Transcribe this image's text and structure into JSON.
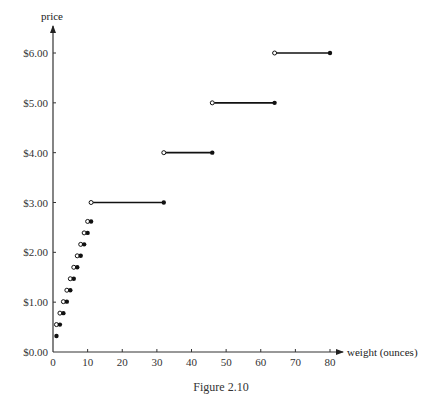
{
  "chart_data": {
    "type": "step",
    "title": "",
    "caption": "Figure 2.10",
    "xlabel": "weight (ounces)",
    "ylabel": "price",
    "xlim": [
      0,
      80
    ],
    "ylim": [
      0,
      6
    ],
    "xticks": [
      0,
      10,
      20,
      30,
      40,
      50,
      60,
      70,
      80
    ],
    "xtick_labels": [
      "0",
      "10",
      "20",
      "30",
      "40",
      "50",
      "60",
      "70",
      "80"
    ],
    "yticks": [
      0,
      1,
      2,
      3,
      4,
      5,
      6
    ],
    "ytick_labels": [
      "$0.00",
      "$1.00",
      "$2.00",
      "$3.00",
      "$4.00",
      "$5.00",
      "$6.00"
    ],
    "grid": false,
    "legend": null,
    "segments": [
      {
        "x_start": 0,
        "x_end": 1,
        "price": 0.32,
        "open_start": true,
        "closed_end": true
      },
      {
        "x_start": 1,
        "x_end": 2,
        "price": 0.55,
        "open_start": true,
        "closed_end": true
      },
      {
        "x_start": 2,
        "x_end": 3,
        "price": 0.78,
        "open_start": true,
        "closed_end": true
      },
      {
        "x_start": 3,
        "x_end": 4,
        "price": 1.01,
        "open_start": true,
        "closed_end": true
      },
      {
        "x_start": 4,
        "x_end": 5,
        "price": 1.24,
        "open_start": true,
        "closed_end": true
      },
      {
        "x_start": 5,
        "x_end": 6,
        "price": 1.47,
        "open_start": true,
        "closed_end": true
      },
      {
        "x_start": 6,
        "x_end": 7,
        "price": 1.7,
        "open_start": true,
        "closed_end": true
      },
      {
        "x_start": 7,
        "x_end": 8,
        "price": 1.93,
        "open_start": true,
        "closed_end": true
      },
      {
        "x_start": 8,
        "x_end": 9,
        "price": 2.16,
        "open_start": true,
        "closed_end": true
      },
      {
        "x_start": 9,
        "x_end": 10,
        "price": 2.39,
        "open_start": true,
        "closed_end": true
      },
      {
        "x_start": 10,
        "x_end": 11,
        "price": 2.62,
        "open_start": true,
        "closed_end": true
      },
      {
        "x_start": 11,
        "x_end": 32,
        "price": 3.0,
        "open_start": true,
        "closed_end": true
      },
      {
        "x_start": 32,
        "x_end": 46,
        "price": 4.0,
        "open_start": true,
        "closed_end": true
      },
      {
        "x_start": 46,
        "x_end": 64,
        "price": 5.0,
        "open_start": true,
        "closed_end": true
      },
      {
        "x_start": 64,
        "x_end": 80,
        "price": 6.0,
        "open_start": true,
        "closed_end": true
      }
    ]
  },
  "colors": {
    "line": "#111111",
    "axis": "#333333",
    "background": "#ffffff"
  }
}
